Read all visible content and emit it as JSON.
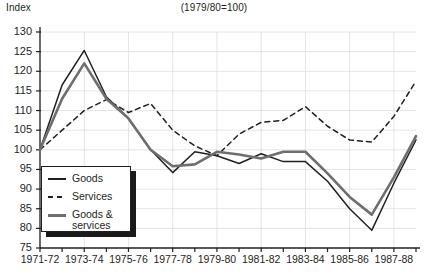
{
  "chart_data": {
    "type": "line",
    "title": "(1979/80=100)",
    "ylabel": "Index",
    "xlabel": "",
    "ylim": [
      75,
      130
    ],
    "yticks": [
      75,
      80,
      85,
      90,
      95,
      100,
      105,
      110,
      115,
      120,
      125,
      130
    ],
    "grid": true,
    "legend_position": "lower-left",
    "x": [
      "1971-72",
      "1972-73",
      "1973-74",
      "1974-75",
      "1975-76",
      "1976-77",
      "1977-78",
      "1978-79",
      "1979-80",
      "1980-81",
      "1981-82",
      "1982-83",
      "1983-84",
      "1984-85",
      "1985-86",
      "1986-87",
      "1987-88",
      "1988-89"
    ],
    "xtick_labels": [
      "1971-72",
      "1973-74",
      "1975-76",
      "1977-78",
      "1979-80",
      "1981-82",
      "1983-84",
      "1985-86",
      "1987-88"
    ],
    "series": [
      {
        "name": "Goods",
        "style": "solid-thin-black",
        "color": "#231f20",
        "values": [
          100.0,
          116.5,
          125.3,
          113.5,
          108.0,
          100.0,
          94.2,
          99.5,
          98.5,
          96.5,
          99.0,
          97.0,
          97.0,
          92.0,
          85.0,
          79.5,
          91.5,
          102.5
        ]
      },
      {
        "name": "Services",
        "style": "dashed-black",
        "color": "#231f20",
        "values": [
          100.0,
          105.0,
          110.0,
          112.8,
          109.5,
          111.8,
          105.0,
          101.0,
          98.5,
          104.0,
          107.0,
          107.5,
          111.0,
          106.0,
          102.5,
          102.0,
          108.5,
          117.5
        ]
      },
      {
        "name": "Goods &\nservices",
        "style": "solid-thick-gray",
        "color": "#6e6e6e",
        "values": [
          100.0,
          113.0,
          122.0,
          113.0,
          108.0,
          100.0,
          95.8,
          96.3,
          99.5,
          98.8,
          97.8,
          99.5,
          99.5,
          94.0,
          88.0,
          83.5,
          93.0,
          103.5
        ]
      }
    ]
  },
  "legend": {
    "items": [
      {
        "label": "Goods"
      },
      {
        "label": "Services"
      },
      {
        "label": "Goods &\nservices"
      }
    ]
  }
}
